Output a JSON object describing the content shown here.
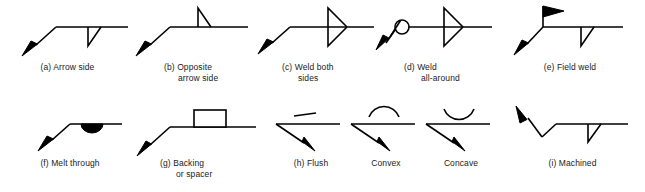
{
  "figure": {
    "background_color": "#ffffff",
    "line_color": "#000000",
    "text_color": "#1a1a1a"
  },
  "panels": [
    {
      "key": "a",
      "label": "(a)",
      "caption": "(a)  Arrow side",
      "caption_lines": [
        "(a)  Arrow side"
      ],
      "symbol": "fillet-weld-arrow-side",
      "elements": [
        "arrow",
        "leader-line",
        "reference-line",
        "fillet-triangle-below"
      ]
    },
    {
      "key": "b",
      "label": "(b)",
      "caption": "(b)  Opposite\narrow side",
      "caption_lines": [
        "(b)  Opposite",
        "arrow side"
      ],
      "symbol": "fillet-weld-other-side",
      "elements": [
        "arrow",
        "leader-line",
        "reference-line",
        "fillet-triangle-above"
      ]
    },
    {
      "key": "c",
      "label": "(c)",
      "caption": "(c)  Weld both\nsides",
      "caption_lines": [
        "(c)  Weld both",
        "sides"
      ],
      "symbol": "fillet-weld-both-sides",
      "elements": [
        "arrow",
        "leader-line",
        "reference-line",
        "fillet-triangle-above",
        "fillet-triangle-below"
      ]
    },
    {
      "key": "d",
      "label": "(d)",
      "caption": "(d)  Weld\nall-around",
      "caption_lines": [
        "(d)  Weld",
        "all-around"
      ],
      "symbol": "weld-all-around",
      "elements": [
        "arrow",
        "leader-line",
        "all-around-circle",
        "reference-line",
        "fillet-triangle-above",
        "fillet-triangle-below"
      ]
    },
    {
      "key": "e",
      "label": "(e)",
      "caption": "(e) Field weld",
      "caption_lines": [
        "(e) Field weld"
      ],
      "symbol": "field-weld",
      "elements": [
        "arrow",
        "leader-line",
        "field-weld-flag",
        "reference-line",
        "fillet-triangle-below"
      ]
    },
    {
      "key": "f",
      "label": "(f)",
      "caption": "(f) Melt through",
      "caption_lines": [
        "(f) Melt through"
      ],
      "symbol": "melt-through",
      "elements": [
        "arrow",
        "leader-line",
        "reference-line",
        "melt-through-half-disc"
      ]
    },
    {
      "key": "g",
      "label": "(g)",
      "caption": "(g) Backing\nor spacer",
      "caption_lines": [
        "(g) Backing",
        "or spacer"
      ],
      "symbol": "backing-or-spacer",
      "elements": [
        "arrow",
        "leader-line",
        "reference-line",
        "backing-rectangle"
      ]
    },
    {
      "key": "h",
      "label": "(h)",
      "caption": "(h) Flush",
      "caption_lines": [
        "(h) Flush"
      ],
      "symbol": "contour-flush",
      "elements": [
        "arrow",
        "reference-line",
        "flush-bar"
      ]
    },
    {
      "key": "h2",
      "label": "",
      "caption": "Convex",
      "caption_lines": [
        "Convex"
      ],
      "symbol": "contour-convex",
      "elements": [
        "arrow",
        "reference-line",
        "convex-arc"
      ]
    },
    {
      "key": "h3",
      "label": "",
      "caption": "Concave",
      "caption_lines": [
        "Concave"
      ],
      "symbol": "contour-concave",
      "elements": [
        "arrow",
        "reference-line",
        "concave-arc"
      ]
    },
    {
      "key": "i",
      "label": "(i)",
      "caption": "(i) Machined",
      "caption_lines": [
        "(i) Machined"
      ],
      "symbol": "machined-finish",
      "elements": [
        "arrow-up-left",
        "leader-line",
        "reference-line",
        "fillet-triangle-below"
      ]
    }
  ]
}
